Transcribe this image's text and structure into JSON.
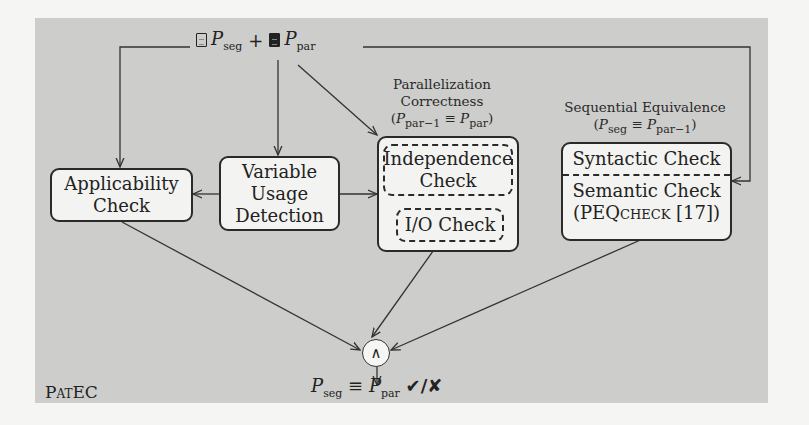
{
  "diagram": {
    "title": "PatEC",
    "inputs": {
      "seq_icon": "file-outline-icon",
      "seq_symbol": "P",
      "seq_sub": "seg",
      "plus": "+",
      "par_icon": "file-filled-icon",
      "par_symbol": "P",
      "par_sub": "par"
    },
    "nodes": {
      "applicability": {
        "line1": "Applicability",
        "line2": "Check"
      },
      "variable_usage": {
        "line1": "Variable",
        "line2": "Usage",
        "line3": "Detection"
      },
      "parallelization": {
        "heading1": "Parallelization",
        "heading2": "Correctness",
        "formula": "(P par−1 ≡ P par)",
        "independence": {
          "line1": "Independence",
          "line2": "Check"
        },
        "io": "I/O Check"
      },
      "sequential": {
        "heading": "Sequential Equivalence",
        "formula": "(P seg ≡ P par−1)",
        "syntactic": "Syntactic Check",
        "semantic_line1": "Semantic Check",
        "semantic_line2_open": "(PEQ",
        "semantic_line2_sc": "check",
        "semantic_line2_close": " [17])"
      },
      "and": "∧"
    },
    "result": {
      "lhs_sub": "seg",
      "equiv": "≡",
      "rhs_sub": "par",
      "outcome": "✔/✘"
    }
  }
}
